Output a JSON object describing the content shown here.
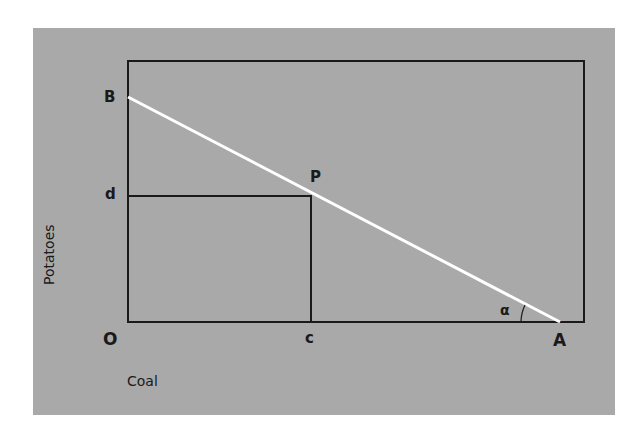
{
  "diagram": {
    "points": {
      "B": "B",
      "d": "d",
      "P": "P",
      "O": "O",
      "c": "c",
      "A": "A"
    },
    "angle_label": "α",
    "axes": {
      "y_label": "Potatoes",
      "x_label": "Coal"
    },
    "colors": {
      "panel": "#a9a9a9",
      "frame": "#1a1a1a",
      "line": "#ffffff"
    }
  }
}
